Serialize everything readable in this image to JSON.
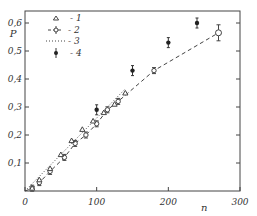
{
  "chart_data": {
    "type": "scatter",
    "title": "",
    "xlabel": "n",
    "ylabel": "P",
    "xlim": [
      0,
      300
    ],
    "ylim": [
      0,
      0.6
    ],
    "x_ticks": [
      0,
      100,
      200,
      300
    ],
    "x_tick_labels": [
      "0",
      "100",
      "200",
      "300"
    ],
    "y_ticks": [
      0.1,
      0.2,
      0.3,
      0.4,
      0.5,
      0.6
    ],
    "y_tick_labels": [
      "0,1",
      "0,2",
      "0,3",
      "0,4",
      "0,5",
      "0,6"
    ],
    "grid": false,
    "legend_position": "upper left",
    "series": [
      {
        "name": "1",
        "marker": "open-triangle",
        "x": [
          10,
          20,
          35,
          50,
          65,
          80,
          95,
          110,
          125,
          140
        ],
        "y": [
          0.01,
          0.04,
          0.08,
          0.13,
          0.18,
          0.22,
          0.25,
          0.28,
          0.31,
          0.35
        ]
      },
      {
        "name": "2",
        "marker": "open-circle-errorbar",
        "line": "dashed",
        "x": [
          10,
          20,
          35,
          55,
          70,
          85,
          100,
          115,
          130,
          180,
          270
        ],
        "y": [
          0.01,
          0.03,
          0.07,
          0.12,
          0.17,
          0.2,
          0.24,
          0.29,
          0.32,
          0.43,
          0.565
        ]
      },
      {
        "name": "3",
        "marker": "none",
        "line": "dotted",
        "x": [
          0,
          140
        ],
        "y": [
          0.0,
          0.365
        ]
      },
      {
        "name": "4",
        "marker": "filled-circle-errorbar",
        "x": [
          100,
          150,
          200,
          240
        ],
        "y": [
          0.29,
          0.43,
          0.53,
          0.6
        ]
      }
    ]
  },
  "legend": [
    {
      "label": "- 1"
    },
    {
      "label": "- 2"
    },
    {
      "label": "- 3"
    },
    {
      "label": "- 4"
    }
  ],
  "axis": {
    "x_label": "n",
    "y_label": "P"
  }
}
